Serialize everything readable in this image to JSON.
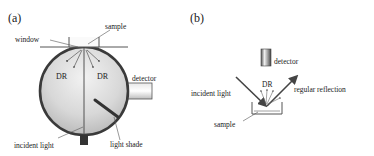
{
  "panel_a": {
    "tag": "(a)",
    "labels": {
      "sample": "sample",
      "window": "window",
      "dr_left": "DR",
      "dr_right": "DR",
      "detector": "detector",
      "incident_light": "incident light",
      "light_shade": "light shade"
    }
  },
  "panel_b": {
    "tag": "(b)",
    "labels": {
      "detector": "detector",
      "dr": "DR",
      "incident_light": "incident light",
      "regular_reflection": "regular reflection",
      "sample": "sample"
    }
  }
}
